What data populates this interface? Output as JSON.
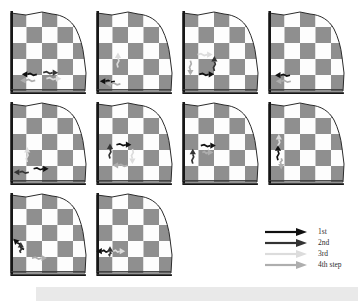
{
  "figure": {
    "grid_rows": 3,
    "grid_cols": 4,
    "tile_count": 10
  },
  "board": {
    "rows": 5,
    "cols": 5,
    "dark_color": "#8f8f8f",
    "light_color": "#fdfdfd",
    "outline_color": "#2b2b2b",
    "axis_color": "#161616"
  },
  "steps": {
    "1": "#101010",
    "2": "#333333",
    "3": "#dcdcdc",
    "4": "#aeaeae"
  },
  "legend": {
    "items": [
      {
        "label": "1st",
        "step": 1
      },
      {
        "label": "2nd",
        "step": 2
      },
      {
        "label": "3rd",
        "step": 3
      },
      {
        "label": "4th step",
        "step": 4
      }
    ]
  },
  "tiles": [
    {
      "id": "r1c1",
      "arrows": [
        {
          "x": 36,
          "y": 76,
          "dir": "left",
          "step": 1
        },
        {
          "x": 44,
          "y": 74,
          "dir": "right",
          "step": 2
        },
        {
          "x": 34,
          "y": 83,
          "dir": "left",
          "step": 4
        },
        {
          "x": 48,
          "y": 81,
          "dir": "right",
          "step": 3
        }
      ]
    },
    {
      "id": "r1c2",
      "arrows": [
        {
          "x": 30,
          "y": 68,
          "dir": "up",
          "step": 3
        },
        {
          "x": 26,
          "y": 84,
          "dir": "left",
          "step": 1
        },
        {
          "x": 33,
          "y": 87,
          "dir": "left",
          "step": 4
        }
      ]
    },
    {
      "id": "r1c3",
      "arrows": [
        {
          "x": 22,
          "y": 53,
          "dir": "right",
          "step": 3
        },
        {
          "x": 13,
          "y": 60,
          "dir": "down",
          "step": 4
        },
        {
          "x": 24,
          "y": 76,
          "dir": "right",
          "step": 1
        },
        {
          "x": 43,
          "y": 72,
          "dir": "up",
          "step": 2
        }
      ]
    },
    {
      "id": "r1c4",
      "arrows": [
        {
          "x": 30,
          "y": 77,
          "dir": "left",
          "step": 1
        },
        {
          "x": 31,
          "y": 84,
          "dir": "left",
          "step": 4
        }
      ]
    },
    {
      "id": "r2c1",
      "arrows": [
        {
          "x": 24,
          "y": 72,
          "dir": "up",
          "step": 3
        },
        {
          "x": 32,
          "y": 80,
          "dir": "right",
          "step": 1
        },
        {
          "x": 26,
          "y": 84,
          "dir": "left",
          "step": 2
        }
      ]
    },
    {
      "id": "r2c2",
      "arrows": [
        {
          "x": 28,
          "y": 52,
          "dir": "right",
          "step": 1
        },
        {
          "x": 20,
          "y": 68,
          "dir": "up",
          "step": 2
        },
        {
          "x": 48,
          "y": 57,
          "dir": "down",
          "step": 3
        },
        {
          "x": 42,
          "y": 76,
          "dir": "left",
          "step": 4
        }
      ]
    },
    {
      "id": "r2c3",
      "arrows": [
        {
          "x": 26,
          "y": 53,
          "dir": "right",
          "step": 1
        },
        {
          "x": 28,
          "y": 61,
          "dir": "right",
          "step": 4,
          "len": 11
        },
        {
          "x": 16,
          "y": 74,
          "dir": "up",
          "step": 2
        }
      ]
    },
    {
      "id": "r2c4",
      "arrows": [
        {
          "x": 16,
          "y": 57,
          "dir": "up",
          "step": 3
        },
        {
          "x": 15,
          "y": 70,
          "dir": "up",
          "step": 1
        },
        {
          "x": 19,
          "y": 68,
          "dir": "down",
          "step": 4,
          "len": 11
        }
      ]
    },
    {
      "id": "r3c1",
      "arrows": [
        {
          "x": 20,
          "y": 68,
          "dir": "up-left",
          "step": 1
        },
        {
          "x": 16,
          "y": 72,
          "dir": "up",
          "step": 2,
          "len": 11
        },
        {
          "x": 30,
          "y": 78,
          "dir": "right",
          "step": 4
        }
      ]
    },
    {
      "id": "r3c2",
      "arrows": [
        {
          "x": 18,
          "y": 70,
          "dir": "left",
          "step": 1,
          "len": 12
        },
        {
          "x": 24,
          "y": 70,
          "dir": "right",
          "step": 3,
          "len": 12
        },
        {
          "x": 20,
          "y": 76,
          "dir": "up",
          "step": 2,
          "len": 10
        }
      ]
    }
  ]
}
